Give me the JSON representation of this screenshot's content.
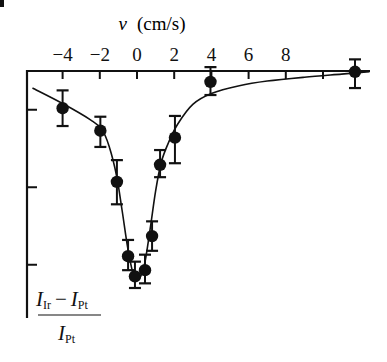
{
  "chart_data": {
    "type": "scatter",
    "title": "",
    "xlabel": "v (cm/s)",
    "xlabel_var": "v",
    "xlabel_unit": "(cm/s)",
    "ylabel": "(I_Ir − I_Pt) / I_Pt",
    "ylabel_parts": {
      "num_a": "I",
      "num_a_sub": "Ir",
      "minus": "−",
      "num_b": "I",
      "num_b_sub": "Pt",
      "den": "I",
      "den_sub": "Pt"
    },
    "x_axis_position": "top",
    "xlim": [
      -5.75,
      12.5
    ],
    "x_ticks": [
      -4,
      -2,
      0,
      2,
      4,
      6,
      8,
      10
    ],
    "x_tick_labels": [
      "−4",
      "−2",
      "0",
      "2",
      "4",
      "6",
      "8",
      ""
    ],
    "ylim": [
      -0.3,
      0
    ],
    "y_ticks": [
      -0.05,
      -0.15,
      -0.25
    ],
    "y_tick_labels": [
      "",
      "",
      ""
    ],
    "grid": false,
    "legend": null,
    "series": [
      {
        "name": "measured",
        "marker": "filled-circle",
        "error_bars": true,
        "points": [
          {
            "x": -4.0,
            "y": -0.048,
            "err_lo": -0.071,
            "err_hi": -0.025
          },
          {
            "x": -1.97,
            "y": -0.077,
            "err_lo": -0.098,
            "err_hi": -0.059
          },
          {
            "x": -1.08,
            "y": -0.143,
            "err_lo": -0.172,
            "err_hi": -0.115
          },
          {
            "x": -0.48,
            "y": -0.239,
            "err_lo": -0.257,
            "err_hi": -0.218
          },
          {
            "x": -0.11,
            "y": -0.265,
            "err_lo": -0.28,
            "err_hi": -0.246
          },
          {
            "x": 0.43,
            "y": -0.257,
            "err_lo": -0.274,
            "err_hi": -0.237
          },
          {
            "x": 0.81,
            "y": -0.213,
            "err_lo": -0.232,
            "err_hi": -0.194
          },
          {
            "x": 1.24,
            "y": -0.121,
            "err_lo": -0.137,
            "err_hi": -0.102
          },
          {
            "x": 2.04,
            "y": -0.086,
            "err_lo": -0.119,
            "err_hi": -0.058
          },
          {
            "x": 3.95,
            "y": -0.014,
            "err_lo": -0.031,
            "err_hi": 0.005
          },
          {
            "x": 11.72,
            "y": -0.001,
            "err_lo": -0.022,
            "err_hi": 0.015
          }
        ]
      },
      {
        "name": "fit",
        "type": "line",
        "points": [
          [
            -5.62,
            -0.022
          ],
          [
            -4.0,
            -0.042
          ],
          [
            -2.5,
            -0.063
          ],
          [
            -1.9,
            -0.075
          ],
          [
            -1.5,
            -0.097
          ],
          [
            -1.1,
            -0.135
          ],
          [
            -0.8,
            -0.18
          ],
          [
            -0.5,
            -0.228
          ],
          [
            -0.2,
            -0.262
          ],
          [
            0.1,
            -0.268
          ],
          [
            0.4,
            -0.25
          ],
          [
            0.7,
            -0.205
          ],
          [
            1.0,
            -0.155
          ],
          [
            1.3,
            -0.118
          ],
          [
            1.7,
            -0.092
          ],
          [
            2.2,
            -0.068
          ],
          [
            3.0,
            -0.043
          ],
          [
            4.0,
            -0.029
          ],
          [
            5.5,
            -0.019
          ],
          [
            7.0,
            -0.013
          ],
          [
            9.0,
            -0.008
          ],
          [
            11.0,
            -0.004
          ],
          [
            12.5,
            -0.001
          ]
        ]
      }
    ]
  },
  "layout": {
    "origin_px": {
      "x0": 137,
      "y0": 71
    },
    "px_per_x_unit": 18.6,
    "px_per_y_unit": 775,
    "axis_left_px": 27,
    "axis_right_px": 370,
    "axis_bottom_px": 318,
    "ink_color": "#111111"
  }
}
